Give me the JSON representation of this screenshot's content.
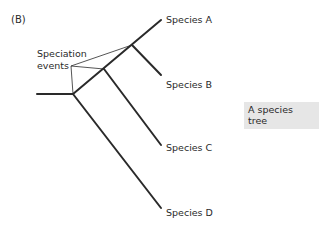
{
  "panel": {
    "label": "(B)"
  },
  "callout": {
    "line1": "Speciation",
    "line2": "events"
  },
  "species": [
    {
      "label": "Species A"
    },
    {
      "label": "Species B"
    },
    {
      "label": "Species C"
    },
    {
      "label": "Species D"
    }
  ],
  "caption": {
    "text": "A species tree"
  },
  "colors": {
    "line": "#2a2a2a",
    "caption_bg": "#e6e6e6"
  }
}
